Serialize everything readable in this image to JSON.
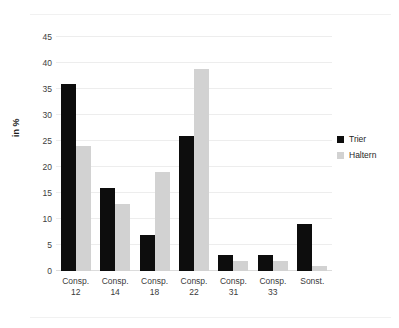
{
  "chart_data": {
    "type": "bar",
    "title": "",
    "subtitle": "",
    "xlabel": "",
    "ylabel": "in %",
    "ylim": [
      0,
      47
    ],
    "yticks": [
      0,
      5,
      10,
      15,
      20,
      25,
      30,
      35,
      40,
      45
    ],
    "ytick_labels": [
      "0",
      "5",
      "10",
      "15",
      "20",
      "25",
      "30",
      "35",
      "40",
      "45"
    ],
    "grid": true,
    "legend_position": "right",
    "categories": [
      "Consp. 12",
      "Consp. 14",
      "Consp. 18",
      "Consp. 22",
      "Consp. 31",
      "Consp. 33",
      "Sonst."
    ],
    "category_lines": [
      [
        "Consp.",
        "12"
      ],
      [
        "Consp.",
        "14"
      ],
      [
        "Consp.",
        "18"
      ],
      [
        "Consp.",
        "22"
      ],
      [
        "Consp.",
        "31"
      ],
      [
        "Consp.",
        "33"
      ],
      [
        "Sonst.",
        ""
      ]
    ],
    "series": [
      {
        "name": "Trier",
        "color": "#0d0d0d",
        "values": [
          36,
          16,
          7,
          26,
          3,
          3,
          9
        ]
      },
      {
        "name": "Haltern",
        "color": "#d2d2d2",
        "values": [
          24,
          13,
          19,
          39,
          2,
          2,
          1
        ]
      }
    ]
  },
  "legend": {
    "items": [
      {
        "label": "Trier",
        "color": "#0d0d0d"
      },
      {
        "label": "Haltern",
        "color": "#d2d2d2"
      }
    ]
  }
}
